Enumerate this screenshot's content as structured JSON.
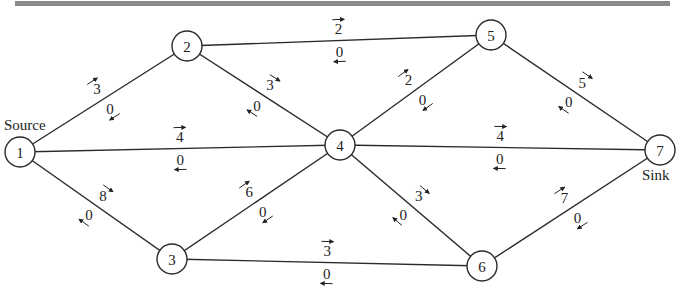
{
  "diagram": {
    "type": "flow-network",
    "source_label": "Source",
    "sink_label": "Sink",
    "colors": {
      "line": "#2a2a2a",
      "topbar": "#8a8a8a",
      "background": "#ffffff"
    },
    "nodes": [
      {
        "id": "1",
        "x": 20,
        "y": 152
      },
      {
        "id": "2",
        "x": 187,
        "y": 46
      },
      {
        "id": "3",
        "x": 172,
        "y": 259
      },
      {
        "id": "4",
        "x": 340,
        "y": 145
      },
      {
        "id": "5",
        "x": 491,
        "y": 35
      },
      {
        "id": "6",
        "x": 482,
        "y": 266
      },
      {
        "id": "7",
        "x": 660,
        "y": 150
      }
    ],
    "edges": [
      {
        "from": "1",
        "to": "2",
        "forward": "3",
        "backward": "0"
      },
      {
        "from": "1",
        "to": "4",
        "forward": "4",
        "backward": "0"
      },
      {
        "from": "1",
        "to": "3",
        "forward": "8",
        "backward": "0"
      },
      {
        "from": "2",
        "to": "5",
        "forward": "2",
        "backward": "0"
      },
      {
        "from": "2",
        "to": "4",
        "forward": "3",
        "backward": "0"
      },
      {
        "from": "3",
        "to": "4",
        "forward": "6",
        "backward": "0"
      },
      {
        "from": "3",
        "to": "6",
        "forward": "3",
        "backward": "0"
      },
      {
        "from": "4",
        "to": "5",
        "forward": "2",
        "backward": "0"
      },
      {
        "from": "4",
        "to": "7",
        "forward": "4",
        "backward": "0"
      },
      {
        "from": "4",
        "to": "6",
        "forward": "3",
        "backward": "0"
      },
      {
        "from": "5",
        "to": "7",
        "forward": "5",
        "backward": "0"
      },
      {
        "from": "6",
        "to": "7",
        "forward": "7",
        "backward": "0"
      }
    ]
  }
}
